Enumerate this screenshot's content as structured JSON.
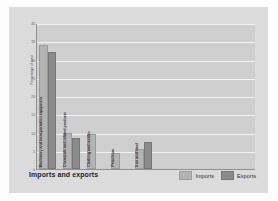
{
  "chart_data": {
    "type": "bar",
    "title": "Imports and exports",
    "xlabel": "",
    "ylabel": "Percentage of total",
    "ylim": [
      0,
      40
    ],
    "yticks": [
      40,
      35,
      30,
      25,
      20,
      15,
      10,
      5,
      0
    ],
    "grid": true,
    "legend_position": "bottom-right",
    "categories": [
      "Machinery and transportation equipment",
      "Chemicals and related products",
      "Clothing and textiles",
      "Petroleum",
      "Iron and steel"
    ],
    "series": [
      {
        "name": "Imports",
        "color": "#b4b4b4",
        "values": [
          34,
          10,
          9.5,
          4.5,
          5.5
        ]
      },
      {
        "name": "Exports",
        "color": "#8a8a8a",
        "values": [
          32,
          8.5,
          0,
          0,
          7.5
        ]
      }
    ]
  },
  "legend": {
    "items": [
      {
        "label": "Imports"
      },
      {
        "label": "Exports"
      }
    ]
  }
}
